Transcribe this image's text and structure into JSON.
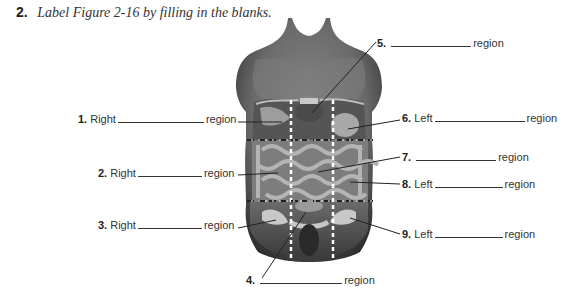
{
  "question": {
    "number": "2.",
    "prompt": "Label Figure 2-16 by filling in the blanks."
  },
  "figure": {
    "label_words": {
      "right": "Right",
      "left": "Left",
      "region": "region"
    }
  },
  "labels": [
    {
      "number": "1.",
      "side": "Right",
      "suffix": "region"
    },
    {
      "number": "2.",
      "side": "Right",
      "suffix": "region"
    },
    {
      "number": "3.",
      "side": "Right",
      "suffix": "region"
    },
    {
      "number": "4.",
      "side": "",
      "suffix": "region"
    },
    {
      "number": "5.",
      "side": "",
      "suffix": "region"
    },
    {
      "number": "6.",
      "side": "Left",
      "suffix": "region"
    },
    {
      "number": "7.",
      "side": "",
      "suffix": "region"
    },
    {
      "number": "8.",
      "side": "Left",
      "suffix": "region"
    },
    {
      "number": "9.",
      "side": "Left",
      "suffix": "region"
    }
  ],
  "colors": {
    "skin_dark": "#3a3a3a",
    "skin_mid": "#6e6e6e",
    "skin_light": "#9a9a9a",
    "organ": "#b5b5b5",
    "line": "#222222"
  }
}
